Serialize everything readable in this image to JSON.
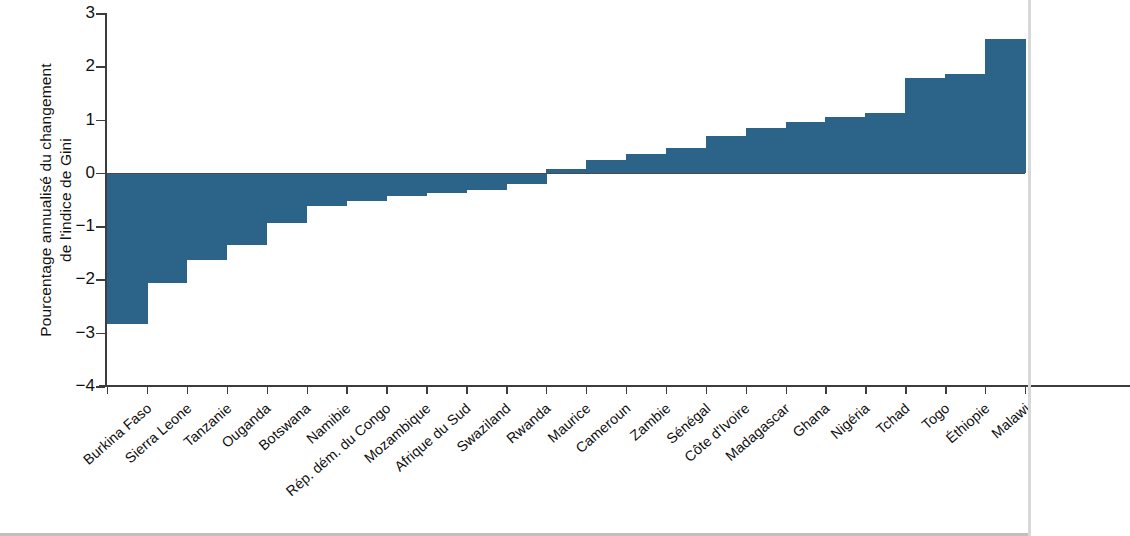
{
  "chart_data": {
    "type": "bar",
    "title": "",
    "xlabel": "",
    "ylabel": "Pourcentage annualisé du changement de l'indice de Gini",
    "ylabel_lines": [
      "Pourcentage annualisé du changement",
      "de l'indice de Gini"
    ],
    "ylim": [
      -4,
      3
    ],
    "yticks": [
      3,
      2,
      1,
      0,
      -1,
      -2,
      -3,
      -4
    ],
    "ytick_labels": [
      "3",
      "2",
      "1",
      "0",
      "−1",
      "−2",
      "−3",
      "−4"
    ],
    "grid": false,
    "legend": null,
    "bar_color": "#2c6389",
    "axis_color": "#3d3d3d",
    "categories": [
      "Burkina Faso",
      "Sierra Leone",
      "Tanzanie",
      "Ouganda",
      "Botswana",
      "Namibie",
      "Rép. dém. du Congo",
      "Mozambique",
      "Afrique du Sud",
      "Swaziland",
      "Rwanda",
      "Maurice",
      "Cameroun",
      "Zambie",
      "Sénégal",
      "Côte d'Ivoire",
      "Madagascar",
      "Ghana",
      "Nigéria",
      "Tchad",
      "Togo",
      "Éthiopie",
      "Malawi"
    ],
    "values": [
      -2.84,
      -2.07,
      -1.63,
      -1.35,
      -0.94,
      -0.63,
      -0.52,
      -0.44,
      -0.38,
      -0.33,
      -0.2,
      0.08,
      0.25,
      0.35,
      0.47,
      0.7,
      0.85,
      0.95,
      1.05,
      1.12,
      1.78,
      1.85,
      2.52
    ]
  }
}
